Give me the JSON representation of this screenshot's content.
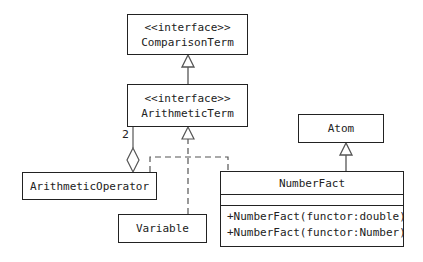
{
  "classes": {
    "comparison_term": {
      "stereotype": "<<interface>>",
      "name": "ComparisonTerm"
    },
    "arithmetic_term": {
      "stereotype": "<<interface>>",
      "name": "ArithmeticTerm"
    },
    "arithmetic_operator": {
      "name": "ArithmeticOperator"
    },
    "variable": {
      "name": "Variable"
    },
    "atom": {
      "name": "Atom"
    },
    "number_fact": {
      "name": "NumberFact",
      "operations": [
        "+NumberFact(functor:double)",
        "+NumberFact(functor:Number)"
      ]
    }
  },
  "relations": {
    "aggregation_multiplicity": "2"
  }
}
